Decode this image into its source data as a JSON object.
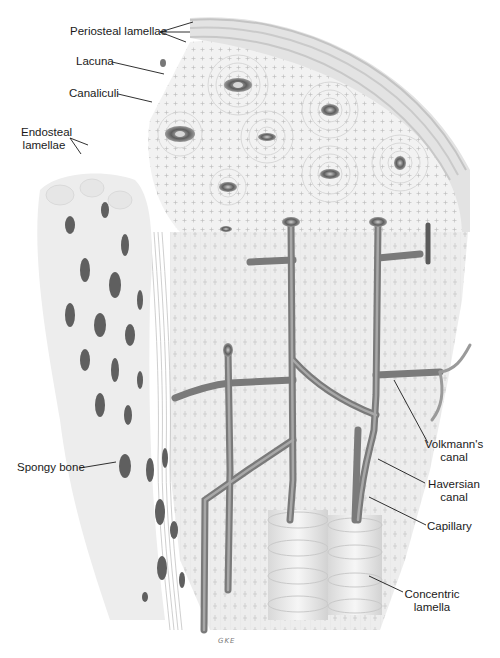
{
  "diagram": {
    "colors": {
      "background": "#ffffff",
      "bone_matrix": "#efefef",
      "lamella_rings": "#d6d6d6",
      "vessels": "#8c8c8c",
      "vessel_dark": "#6e6e6e",
      "leader_lines": "#1a1a1a",
      "label_text": "#1a1a1a"
    },
    "labels": {
      "periosteal_lamellae": "Periosteal lamellae",
      "lacuna": "Lacuna",
      "canaliculi": "Canaliculi",
      "endosteal_lamellae_1": "Endosteal",
      "endosteal_lamellae_2": "lamellae",
      "spongy_bone": "Spongy bone",
      "volkmanns_canal_1": "Volkmann's",
      "volkmanns_canal_2": "canal",
      "haversian_canal_1": "Haversian",
      "haversian_canal_2": "canal",
      "capillary": "Capillary",
      "concentric_lamella_1": "Concentric",
      "concentric_lamella_2": "lamella"
    },
    "signature": "GKE"
  }
}
